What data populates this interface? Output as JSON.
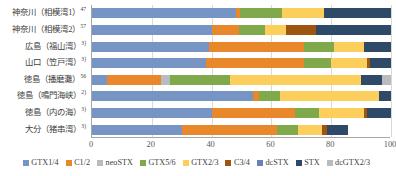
{
  "chart_data": {
    "type": "bar",
    "orientation": "horizontal",
    "stacked": true,
    "title": "",
    "xlabel": "",
    "ylabel": "",
    "xlim": [
      0,
      100
    ],
    "xticks": [
      "0",
      "20",
      "40",
      "60",
      "80",
      "100"
    ],
    "grid": true,
    "legend_position": "bottom",
    "categories": [
      "神奈川（相模湾1）",
      "神奈川（相模湾2）",
      "広島（福山湾）",
      "山口（笠戸湾）",
      "徳島（播磨灘）",
      "徳島（鳴門海峡）",
      "徳島（内の海）",
      "大分（猪串湾）"
    ],
    "category_superscripts": [
      "47",
      "57",
      "3)",
      "3)",
      "56",
      "2)",
      "3)",
      "3)"
    ],
    "series": [
      {
        "name": "GTX1/4",
        "color": "#7694c4",
        "values": [
          48.0,
          40.0,
          39.0,
          38.0,
          5.0,
          54.0,
          40.0,
          30.0
        ]
      },
      {
        "name": "C1/2",
        "color": "#e8882b",
        "values": [
          1.5,
          9.0,
          32.0,
          33.0,
          18.0,
          2.0,
          28.0,
          32.0
        ]
      },
      {
        "name": "neoSTX",
        "color": "#b8bcbe",
        "values": [
          0.0,
          0.0,
          0.0,
          0.0,
          3.0,
          0.0,
          0.0,
          0.0
        ]
      },
      {
        "name": "GTX5/6",
        "color": "#7fa94b",
        "values": [
          14.0,
          9.0,
          10.0,
          9.0,
          20.0,
          7.0,
          8.0,
          7.0
        ]
      },
      {
        "name": "GTX2/3",
        "color": "#fcce5c",
        "values": [
          14.0,
          7.0,
          10.0,
          12.0,
          44.0,
          33.0,
          15.0,
          8.0
        ]
      },
      {
        "name": "C3/4",
        "color": "#9e5510",
        "values": [
          0.0,
          10.0,
          0.0,
          1.0,
          0.0,
          0.0,
          1.0,
          1.5
        ]
      },
      {
        "name": "dcSTX",
        "color": "#6b80b8",
        "values": [
          0.0,
          0.0,
          0.0,
          0.0,
          0.0,
          0.0,
          0.0,
          0.0
        ]
      },
      {
        "name": "STX",
        "color": "#2e4a68",
        "values": [
          22.5,
          25.0,
          9.0,
          7.0,
          7.0,
          4.0,
          8.0,
          7.0
        ]
      },
      {
        "name": "dcGTX2/3",
        "color": "#b8bcbe",
        "values": [
          0.0,
          0.0,
          0.0,
          0.0,
          3.0,
          0.0,
          0.0,
          0.0
        ]
      }
    ]
  },
  "legend": {
    "items": [
      {
        "label": "GTX1/4",
        "color": "#7694c4"
      },
      {
        "label": "C1/2",
        "color": "#e8882b"
      },
      {
        "label": "neoSTX",
        "color": "#b8bcbe"
      },
      {
        "label": "GTX5/6",
        "color": "#7fa94b"
      },
      {
        "label": "GTX2/3",
        "color": "#fcce5c"
      },
      {
        "label": "C3/4",
        "color": "#9e5510"
      },
      {
        "label": "dcSTX",
        "color": "#6b80b8"
      },
      {
        "label": "STX",
        "color": "#2e4a68"
      },
      {
        "label": "dcGTX2/3",
        "color": "#b8bcbe"
      }
    ]
  }
}
